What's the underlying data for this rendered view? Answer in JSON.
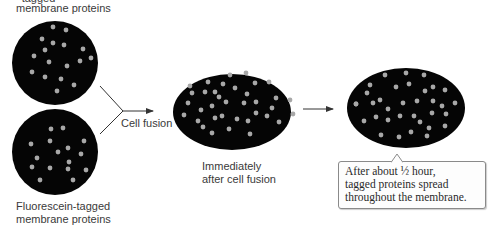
{
  "labels": {
    "top_cell": "membrane proteins",
    "top_cell_partial_line": "-tagged",
    "bottom_cell_line1": "Fluorescein-tagged",
    "bottom_cell_line2": "membrane proteins",
    "arrow1": "Cell fusion",
    "middle_line1": "Immediately",
    "middle_line2": "after cell fusion"
  },
  "callout": {
    "line1": "After about ½ hour,",
    "line2": "tagged proteins spread",
    "line3": "throughout the membrane."
  },
  "colors": {
    "cell": "#050505",
    "protein_dot": "#a8a8a8",
    "text": "#3a3a3a",
    "arrow": "#333333"
  },
  "cells": [
    {
      "name": "top-cell",
      "cx": 55,
      "cy": 63,
      "rx": 43,
      "ry": 42,
      "dots": [
        [
          53,
          27
        ],
        [
          66,
          30
        ],
        [
          42,
          39
        ],
        [
          53,
          43
        ],
        [
          64,
          45
        ],
        [
          45,
          50
        ],
        [
          83,
          49
        ],
        [
          34,
          56
        ],
        [
          49,
          62
        ],
        [
          91,
          58
        ],
        [
          80,
          61
        ],
        [
          67,
          66
        ],
        [
          32,
          72
        ],
        [
          45,
          77
        ],
        [
          61,
          79
        ],
        [
          74,
          85
        ],
        [
          57,
          91
        ]
      ]
    },
    {
      "name": "bottom-cell",
      "cx": 55,
      "cy": 152,
      "rx": 43,
      "ry": 43,
      "dots": [
        [
          51,
          129
        ],
        [
          63,
          128
        ],
        [
          31,
          144
        ],
        [
          50,
          141
        ],
        [
          84,
          141
        ],
        [
          58,
          152
        ],
        [
          68,
          148
        ],
        [
          81,
          154
        ],
        [
          37,
          158
        ],
        [
          69,
          162
        ],
        [
          32,
          167
        ],
        [
          50,
          168
        ],
        [
          68,
          169
        ],
        [
          86,
          170
        ],
        [
          40,
          180
        ],
        [
          73,
          180
        ]
      ]
    },
    {
      "name": "middle-fused-cell",
      "cx": 232,
      "cy": 112,
      "rx": 59,
      "ry": 38,
      "dots": [
        [
          230,
          75
        ],
        [
          246,
          73
        ],
        [
          208,
          82
        ],
        [
          223,
          84
        ],
        [
          190,
          86
        ],
        [
          255,
          83
        ],
        [
          235,
          88
        ],
        [
          269,
          82
        ],
        [
          215,
          92
        ],
        [
          192,
          93
        ],
        [
          205,
          92
        ],
        [
          219,
          97
        ],
        [
          247,
          94
        ],
        [
          276,
          98
        ],
        [
          188,
          103
        ],
        [
          226,
          102
        ],
        [
          256,
          102
        ],
        [
          244,
          103
        ],
        [
          290,
          100
        ],
        [
          272,
          108
        ],
        [
          201,
          110
        ],
        [
          212,
          106
        ],
        [
          256,
          113
        ],
        [
          222,
          116
        ],
        [
          184,
          115
        ],
        [
          198,
          121
        ],
        [
          215,
          118
        ],
        [
          267,
          116
        ],
        [
          279,
          122
        ],
        [
          293,
          114
        ],
        [
          248,
          121
        ],
        [
          237,
          119
        ],
        [
          203,
          127
        ],
        [
          212,
          133
        ],
        [
          229,
          129
        ],
        [
          250,
          134
        ]
      ]
    },
    {
      "name": "right-fused-cell",
      "cx": 406,
      "cy": 108,
      "rx": 59,
      "ry": 40,
      "dots": [
        [
          385,
          75
        ],
        [
          406,
          73
        ],
        [
          424,
          75
        ],
        [
          370,
          85
        ],
        [
          396,
          87
        ],
        [
          409,
          84
        ],
        [
          367,
          93
        ],
        [
          433,
          87
        ],
        [
          445,
          90
        ],
        [
          425,
          91
        ],
        [
          356,
          104
        ],
        [
          373,
          103
        ],
        [
          380,
          100
        ],
        [
          403,
          103
        ],
        [
          417,
          101
        ],
        [
          433,
          101
        ],
        [
          388,
          109
        ],
        [
          356,
          104
        ],
        [
          442,
          106
        ],
        [
          455,
          103
        ],
        [
          432,
          113
        ],
        [
          446,
          114
        ],
        [
          376,
          117
        ],
        [
          388,
          120
        ],
        [
          400,
          116
        ],
        [
          414,
          116
        ],
        [
          364,
          121
        ],
        [
          420,
          122
        ],
        [
          429,
          128
        ],
        [
          445,
          126
        ],
        [
          381,
          135
        ],
        [
          399,
          137
        ],
        [
          411,
          132
        ],
        [
          427,
          136
        ]
      ]
    }
  ]
}
